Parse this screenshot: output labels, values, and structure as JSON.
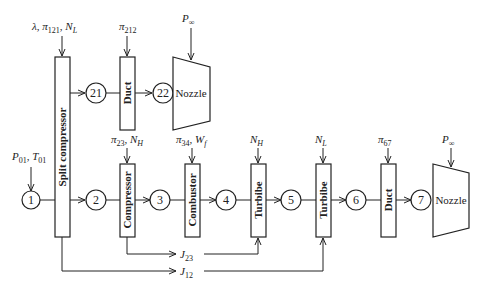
{
  "diagram": {
    "nodes": [
      "1",
      "2",
      "3",
      "4",
      "5",
      "6",
      "7",
      "21",
      "22"
    ],
    "components": {
      "split_compressor": "Split compressor",
      "duct_top": "Duct",
      "nozzle_top": "Nozzle",
      "compressor": "Compressor",
      "combustor": "Combustor",
      "turbine_high": "Turbibe",
      "turbine_low": "Turbibe",
      "duct_bottom": "Duct",
      "nozzle_bottom": "Nozzle"
    },
    "inputs": {
      "inlet": {
        "p": "P",
        "p_sub": "01",
        "sep": ", ",
        "t": "T",
        "t_sub": "01"
      },
      "split_compressor": {
        "lambda": "λ, ",
        "pi": "π",
        "pi_sub": "121",
        "sep": ", ",
        "n": "N",
        "n_sub": "L"
      },
      "duct_top": {
        "pi": "π",
        "pi_sub": "212"
      },
      "nozzle_top": {
        "p": "P",
        "p_sub": "∞"
      },
      "compressor": {
        "pi": "π",
        "pi_sub": "23",
        "sep": ", ",
        "n": "N",
        "n_sub": "H"
      },
      "combustor": {
        "pi": "π",
        "pi_sub": "34",
        "sep": ", ",
        "w": "W",
        "w_sub": "f"
      },
      "turbine_high": {
        "n": "N",
        "n_sub": "H"
      },
      "turbine_low": {
        "n": "N",
        "n_sub": "L"
      },
      "duct_bottom": {
        "pi": "π",
        "pi_sub": "67"
      },
      "nozzle_bottom": {
        "p": "P",
        "p_sub": "∞"
      }
    },
    "shaft_links": {
      "j23": {
        "j": "J",
        "sub": "23"
      },
      "j12": {
        "j": "J",
        "sub": "12"
      }
    }
  }
}
